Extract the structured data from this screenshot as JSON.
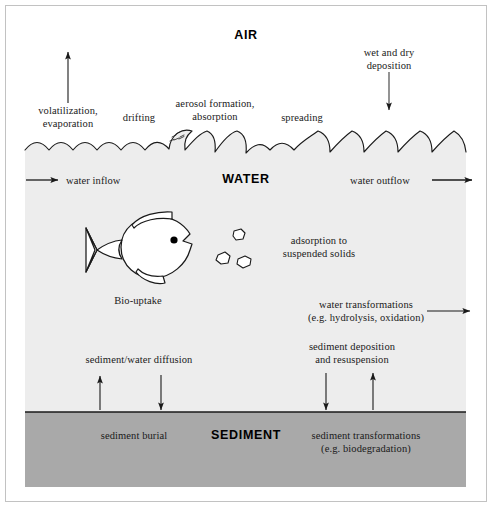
{
  "figure": {
    "title_air": "AIR",
    "title_water": "WATER",
    "title_sediment": "SEDIMENT"
  },
  "colors": {
    "air_fill": "#ffffff",
    "water_fill": "#ededed",
    "sediment_fill": "#a9a9a9",
    "line": "#1a1a1a",
    "text": "#1a1a1a",
    "frame": "#b5b5b5"
  },
  "air_labels": {
    "volatilization": "volatilization,\nevaporation",
    "drifting": "drifting",
    "aerosol": "aerosol formation,\nabsorption",
    "spreading": "spreading",
    "deposition": "wet and dry\ndeposition"
  },
  "water_labels": {
    "inflow": "water inflow",
    "outflow": "water outflow",
    "adsorption": "adsorption to\nsuspended solids",
    "bio_uptake": "Bio-uptake",
    "transformations": "water transformations\n(e.g. hydrolysis, oxidation)",
    "diffusion": "sediment/water diffusion",
    "deposition_resuspension": "sediment deposition\nand resuspension"
  },
  "sediment_labels": {
    "burial": "sediment burial",
    "transformations": "sediment transformations\n(e.g. biodegradation)"
  },
  "icons": {
    "fish": "fish-icon",
    "particles": "suspended-solids-icon",
    "waves": "wave-surface-icon"
  }
}
